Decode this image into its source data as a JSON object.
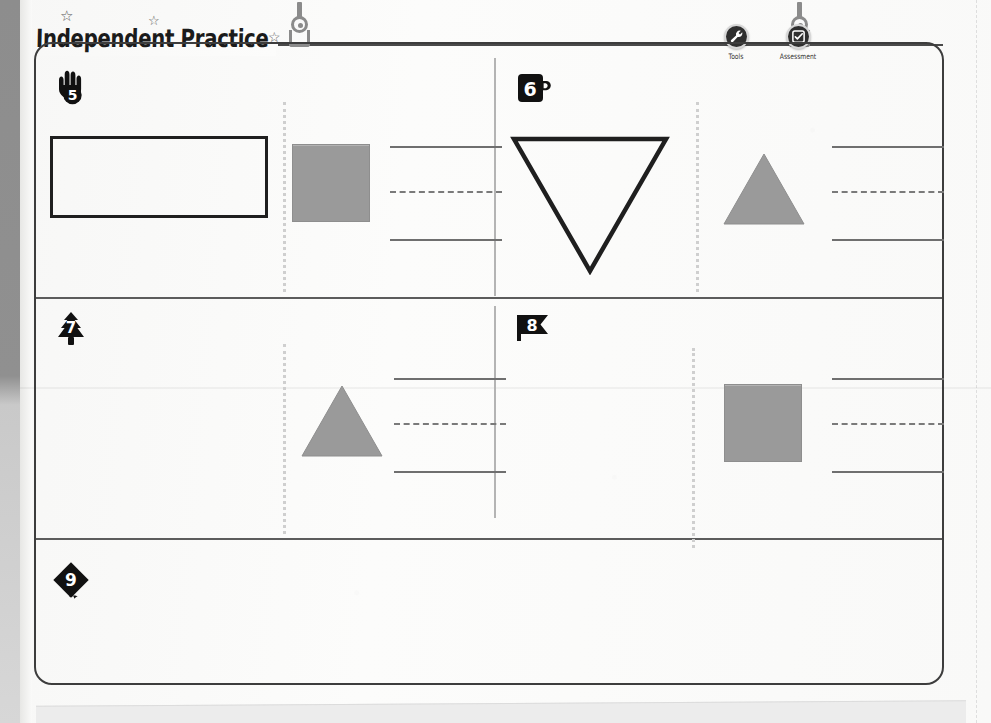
{
  "header": {
    "title": "Independent Practice",
    "stars": [
      "☆",
      "☆",
      "☆"
    ],
    "hanger_left_name": "hanger-clip",
    "hanger_right_name": "hanger-clip"
  },
  "toolbar": {
    "items": [
      {
        "label": "Tools",
        "icon": "wrench-icon"
      },
      {
        "label": "Assessment",
        "icon": "checkbox-icon"
      }
    ]
  },
  "colors": {
    "shape_fill": "#9a9a9a",
    "shape_outline": "#1f1f1f",
    "rule": "#5c5c5c",
    "divider": "#b4b4b4",
    "dotted": "#cfcfcf",
    "line_solid": "#6f6f6f",
    "line_dashed": "#7a7a7a",
    "badge": "#111111",
    "page": "#faf9f8"
  },
  "problems": [
    {
      "number": "5",
      "badge_shape": "hand",
      "left_shape": {
        "type": "rectangle",
        "style": "outline",
        "width": 218,
        "height": 82
      },
      "right_shape": {
        "type": "square",
        "style": "filled",
        "size": 78
      },
      "answer_lines": {
        "top": "solid",
        "middle": "dashed",
        "bottom": "solid"
      }
    },
    {
      "number": "6",
      "badge_shape": "mug",
      "left_shape": {
        "type": "triangle-down",
        "style": "outline",
        "width": 152,
        "height": 135
      },
      "right_shape": {
        "type": "triangle-up",
        "style": "filled",
        "width": 78,
        "height": 70
      },
      "answer_lines": {
        "top": "solid",
        "middle": "dashed",
        "bottom": "solid"
      }
    },
    {
      "number": "7",
      "badge_shape": "tree",
      "left_shape": null,
      "right_shape": {
        "type": "triangle-up",
        "style": "filled",
        "width": 78,
        "height": 70
      },
      "answer_lines": {
        "top": "solid",
        "middle": "dashed",
        "bottom": "solid"
      }
    },
    {
      "number": "8",
      "badge_shape": "flag",
      "left_shape": null,
      "right_shape": {
        "type": "square",
        "style": "filled",
        "size": 78
      },
      "answer_lines": {
        "top": "solid",
        "middle": "dashed",
        "bottom": "solid"
      }
    },
    {
      "number": "9",
      "badge_shape": "diamond-kite",
      "left_shape": null,
      "right_shape": null,
      "answer_lines": null
    }
  ]
}
